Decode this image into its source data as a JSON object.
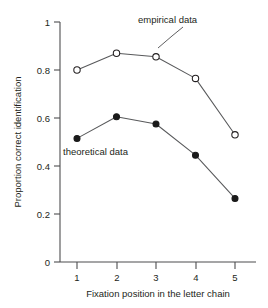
{
  "chart_data": {
    "type": "line",
    "title": "",
    "xlabel": "Fixation position in the letter chain",
    "ylabel": "Proportion correct identification",
    "x": [
      1,
      2,
      3,
      4,
      5
    ],
    "xticklabels": [
      "1",
      "2",
      "3",
      "4",
      "5"
    ],
    "yticks": [
      0,
      0.2,
      0.4,
      0.6,
      0.8,
      1
    ],
    "yticklabels": [
      "0",
      "0.2",
      "0.4",
      "0.6",
      "0.8",
      "1"
    ],
    "xlim": [
      0.6,
      5.45
    ],
    "ylim": [
      0,
      1
    ],
    "grid": false,
    "legend_position": "inline-annotations",
    "series": [
      {
        "name": "empirical data",
        "marker": "open-circle",
        "values": [
          0.8,
          0.87,
          0.855,
          0.765,
          0.53
        ]
      },
      {
        "name": "theoretical data",
        "marker": "filled-circle",
        "values": [
          0.515,
          0.605,
          0.575,
          0.445,
          0.265
        ]
      }
    ],
    "annotations": [
      {
        "text": "empirical data",
        "points_to_series": "empirical data",
        "points_to_x": 3
      },
      {
        "text": "theoretical data",
        "points_to_series": "theoretical data"
      }
    ]
  }
}
